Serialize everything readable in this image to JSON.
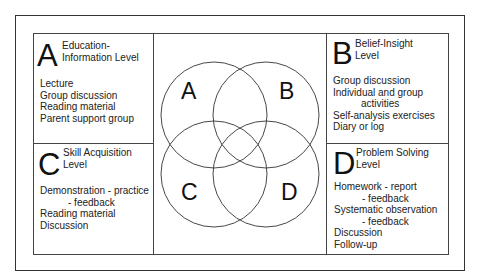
{
  "diagram": {
    "type": "venn",
    "circles": [
      "A",
      "B",
      "C",
      "D"
    ]
  },
  "panels": {
    "a": {
      "letter": "A",
      "title_line1": "Education-",
      "title_line2": "Information Level",
      "items": [
        "Lecture",
        "Group discussion",
        "Reading material",
        "Parent support group"
      ]
    },
    "b": {
      "letter": "B",
      "title_line1": "Belief-Insight",
      "title_line2": "Level",
      "items": [
        "Group discussion",
        "Individual and group",
        "activities",
        "Self-analysis exercises",
        "Diary or log"
      ]
    },
    "c": {
      "letter": "C",
      "title_line1": "Skill Acquisition",
      "title_line2": "Level",
      "items": [
        "Demonstration - practice",
        "- feedback",
        "Reading material",
        "Discussion"
      ]
    },
    "d": {
      "letter": "D",
      "title_line1": "Problem Solving",
      "title_line2": "Level",
      "items": [
        "Homework - report",
        "- feedback",
        "Systematic observation",
        "- feedback",
        "Discussion",
        "Follow-up"
      ]
    }
  },
  "venn": {
    "label_a": "A",
    "label_b": "B",
    "label_c": "C",
    "label_d": "D"
  }
}
